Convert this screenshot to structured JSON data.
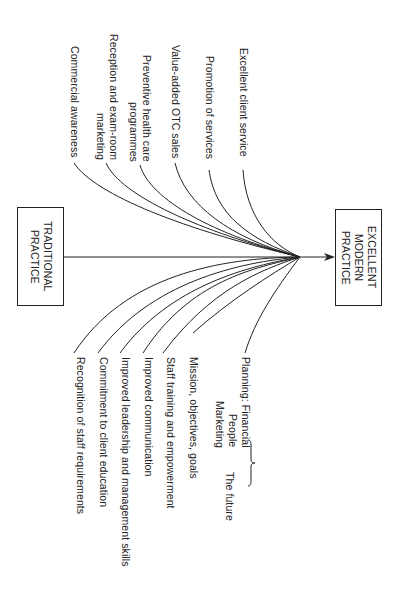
{
  "diagram": {
    "orientation": "rotated-90-clockwise",
    "source_box": {
      "label_line1": "TRADITIONAL",
      "label_line2": "PRACTICE"
    },
    "target_box": {
      "label_line1": "EXCELLENT",
      "label_line2": "MODERN",
      "label_line3": "PRACTICE"
    },
    "upper_branches": [
      {
        "line1": "Excellent client service"
      },
      {
        "line1": "Promotion of services"
      },
      {
        "line1": "Value-added OTC sales"
      },
      {
        "line1": "Preventive health care",
        "line2": "programmes"
      },
      {
        "line1": "Reception and exam-room",
        "line2": "marketing"
      },
      {
        "line1": "Commercial awareness"
      }
    ],
    "lower_branches": [
      {
        "line1": "Planning: Financial",
        "line2": "People",
        "line3": "Marketing"
      },
      {
        "line1": "Mission, objectives, goals"
      },
      {
        "line1": "Staff training and empowerment"
      },
      {
        "line1": "Improved communication"
      },
      {
        "line1": "Improved leadership and management skills"
      },
      {
        "line1": "Commitment to client education"
      },
      {
        "line1": "Recognition of staff requirements"
      }
    ],
    "brace_label": "The future",
    "colors": {
      "line": "#222222",
      "background": "#ffffff"
    }
  }
}
